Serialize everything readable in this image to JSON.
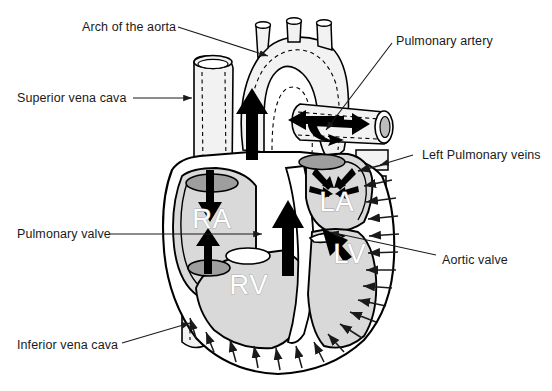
{
  "figure": {
    "type": "anatomical-diagram",
    "background_color": "#ffffff",
    "line_color": "#000000",
    "tissue_fill": "#d9d9d9",
    "vessel_fill": "#f2f2f2",
    "valve_fill": "#9e9e9e",
    "chamber_label_fill": "#ffffff",
    "chamber_label_stroke": "#b0b0b0"
  },
  "labels": [
    {
      "id": "arch-of-the-aorta",
      "text": "Arch of the aorta",
      "x": 82,
      "y": 20,
      "align": "left"
    },
    {
      "id": "superior-vena-cava",
      "text": "Superior vena cava",
      "x": 17,
      "y": 95,
      "align": "left"
    },
    {
      "id": "pulmonary-valve",
      "text": "Pulmonary valve",
      "x": 17,
      "y": 231,
      "align": "left"
    },
    {
      "id": "inferior-vena-cava",
      "text": "Inferior vena cava",
      "x": 17,
      "y": 345,
      "align": "left"
    },
    {
      "id": "pulmonary-artery",
      "text": "Pulmonary artery",
      "x": 396,
      "y": 36,
      "align": "left"
    },
    {
      "id": "left-pulmonary-veins",
      "text": "Left Pulmonary veins",
      "x": 417,
      "y": 149,
      "align": "left"
    },
    {
      "id": "aortic-valve",
      "text": "Aortic valve",
      "x": 440,
      "y": 254,
      "align": "left"
    }
  ],
  "chambers": [
    {
      "id": "right-atrium",
      "abbr": "RA",
      "x": 212,
      "y": 228
    },
    {
      "id": "right-ventricle",
      "abbr": "RV",
      "x": 249,
      "y": 294
    },
    {
      "id": "left-atrium",
      "abbr": "LA",
      "x": 337,
      "y": 211
    },
    {
      "id": "left-ventricle",
      "abbr": "LV",
      "x": 350,
      "y": 263
    }
  ],
  "flow_arrows": [
    {
      "id": "svc-inflow-arrow",
      "description": "Thick arrow pointing down into right atrium from superior vena cava"
    },
    {
      "id": "ivc-inflow-arrow",
      "description": "Thick arrow pointing up into right atrium from inferior vena cava"
    },
    {
      "id": "rv-outflow-arrow",
      "description": "Thick arrow pointing up from right ventricle through pulmonary valve"
    },
    {
      "id": "aortic-arch-arrow",
      "description": "Thick arrow pointing up through the ascending aorta into the arch"
    },
    {
      "id": "pulmonary-trunk-arrows",
      "description": "Branching thick arrows pointing left and right along the pulmonary artery"
    },
    {
      "id": "pulmonary-vein-arrows",
      "description": "Four converging arrows entering the left atrium from the pulmonary veins"
    },
    {
      "id": "lv-outflow-arrow",
      "description": "Thick arrow pointing up-left from left ventricle through the aortic valve"
    },
    {
      "id": "myocardium-arrows",
      "description": "Thin arrows around the left ventricular wall pointing inward"
    }
  ]
}
